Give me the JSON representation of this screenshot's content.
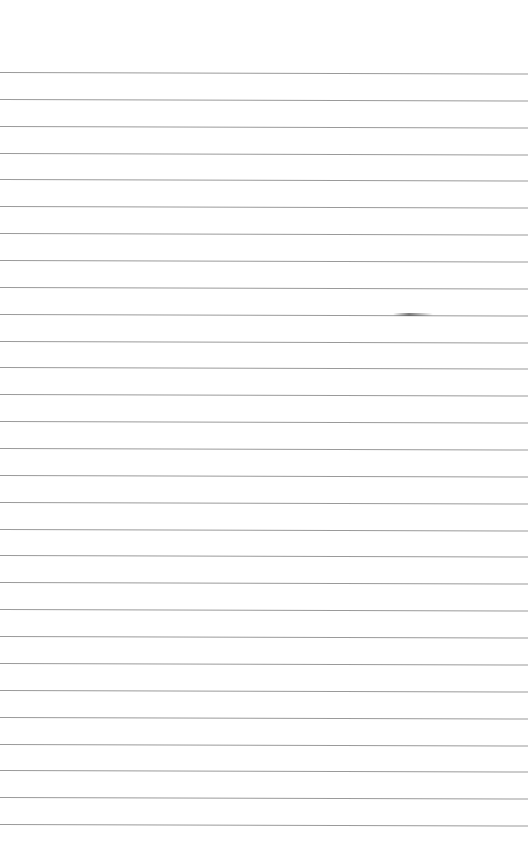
{
  "page": {
    "type": "blank lined paper",
    "background": "#ffffff",
    "line_color": "#9a9a9a",
    "first_line_y": 72,
    "line_spacing": 26.86,
    "line_count": 29
  }
}
